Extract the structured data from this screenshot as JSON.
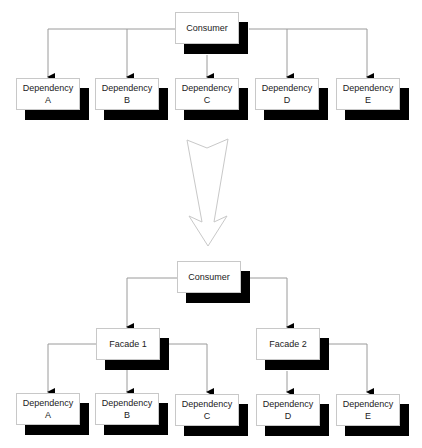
{
  "colors": {
    "line": "#9a9a9a",
    "shadow": "#000000",
    "box_border": "#c8c8c8",
    "text": "#222222"
  },
  "before": {
    "consumer": {
      "label": "Consumer"
    },
    "dependencies": [
      {
        "line1": "Dependency",
        "line2": "A"
      },
      {
        "line1": "Dependency",
        "line2": "B"
      },
      {
        "line1": "Dependency",
        "line2": "C"
      },
      {
        "line1": "Dependency",
        "line2": "D"
      },
      {
        "line1": "Dependency",
        "line2": "E"
      }
    ]
  },
  "transition": {
    "icon": "large-down-arrow"
  },
  "after": {
    "consumer": {
      "label": "Consumer"
    },
    "facades": [
      {
        "label": "Facade 1"
      },
      {
        "label": "Facade 2"
      }
    ],
    "dependencies": [
      {
        "line1": "Dependency",
        "line2": "A"
      },
      {
        "line1": "Dependency",
        "line2": "B"
      },
      {
        "line1": "Dependency",
        "line2": "C"
      },
      {
        "line1": "Dependency",
        "line2": "D"
      },
      {
        "line1": "Dependency",
        "line2": "E"
      }
    ]
  }
}
